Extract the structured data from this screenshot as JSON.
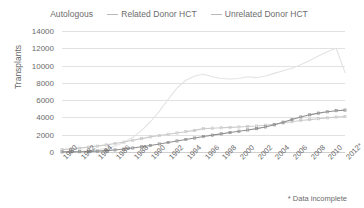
{
  "chart_data": {
    "type": "line",
    "title": "",
    "xlabel": "",
    "ylabel": "Transplants",
    "ylim": [
      0,
      14000
    ],
    "ytick_values": [
      0,
      2000,
      4000,
      6000,
      8000,
      10000,
      12000,
      14000
    ],
    "ytick_labels": [
      "0",
      "2000",
      "4000",
      "6000",
      "8000",
      "10000",
      "12000",
      "14000"
    ],
    "xlim": [
      1980,
      2012
    ],
    "x": [
      1980,
      1981,
      1982,
      1983,
      1984,
      1985,
      1986,
      1987,
      1988,
      1989,
      1990,
      1991,
      1992,
      1993,
      1994,
      1995,
      1996,
      1997,
      1998,
      1999,
      2000,
      2001,
      2002,
      2003,
      2004,
      2005,
      2006,
      2007,
      2008,
      2009,
      2010,
      2011,
      2012
    ],
    "xtick_labels": [
      "1980",
      "1982",
      "1984",
      "1986",
      "1988",
      "1990",
      "1992",
      "1994",
      "1996",
      "1998",
      "2000",
      "2002",
      "2004",
      "2006",
      "2008",
      "2010",
      "2012*"
    ],
    "xtick_values": [
      1980,
      1982,
      1984,
      1986,
      1988,
      1990,
      1992,
      1994,
      1996,
      1998,
      2000,
      2002,
      2004,
      2006,
      2008,
      2010,
      2012
    ],
    "grid": true,
    "legend_position": "top",
    "series": [
      {
        "name": "Autologous",
        "color": "#e3e3e3",
        "marker": "none",
        "values": [
          20,
          40,
          80,
          150,
          260,
          420,
          700,
          1100,
          1700,
          2500,
          3500,
          4700,
          6100,
          7400,
          8300,
          8800,
          9000,
          8700,
          8500,
          8450,
          8500,
          8700,
          8600,
          8800,
          9100,
          9400,
          9700,
          10100,
          10600,
          11100,
          11600,
          12000,
          9200
        ]
      },
      {
        "name": "Related Donor HCT",
        "color": "#cacaca",
        "marker": "square",
        "values": [
          280,
          360,
          450,
          560,
          680,
          820,
          980,
          1150,
          1350,
          1550,
          1750,
          1900,
          2050,
          2200,
          2350,
          2500,
          2700,
          2750,
          2800,
          2850,
          2900,
          2950,
          3000,
          3100,
          3200,
          3350,
          3500,
          3650,
          3750,
          3850,
          3950,
          4050,
          4100
        ]
      },
      {
        "name": "Unrelated Donor HCT",
        "color": "#8f8f8f",
        "marker": "square",
        "values": [
          10,
          20,
          35,
          60,
          100,
          160,
          240,
          340,
          460,
          600,
          760,
          930,
          1100,
          1280,
          1450,
          1620,
          1800,
          1950,
          2100,
          2250,
          2400,
          2550,
          2700,
          2900,
          3150,
          3450,
          3750,
          4050,
          4300,
          4500,
          4650,
          4780,
          4850
        ]
      }
    ],
    "footnote": "* Data incomplete"
  }
}
